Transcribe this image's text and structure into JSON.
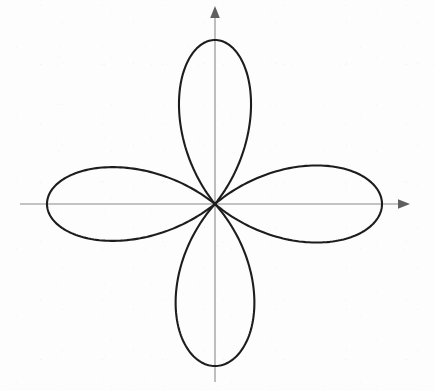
{
  "figure": {
    "name": "four-petaled-rose-curve",
    "background_color": "#fdfdfd",
    "curve_color": "#1d1d1d",
    "axis_color": "#8a8a8a",
    "width": 434,
    "height": 391
  },
  "chart_data": {
    "type": "line",
    "subtype": "polar-rose",
    "title": "",
    "subtitle": "",
    "xlabel": "",
    "ylabel": "",
    "equation": "r = a cos(2θ)",
    "petal_count": 4,
    "petal_amplitude_px": 166,
    "origin_px": {
      "x": 215,
      "y": 204
    },
    "axes": {
      "grid": false,
      "legend": false,
      "x_axis": {
        "from_px": 20,
        "to_px": 410,
        "y_px": 204,
        "arrow": "right"
      },
      "y_axis": {
        "from_px": 6,
        "to_px": 382,
        "x_px": 215,
        "arrow": "up"
      },
      "xlim": [
        -1.17,
        1.17
      ],
      "ylim": [
        -1.19,
        1.19
      ],
      "tick_labels": []
    },
    "petals": [
      {
        "name": "right-petal",
        "theta_center_deg": 0,
        "tip_px": {
          "x": 382,
          "y": 204
        },
        "radius_px": 167,
        "half_width_px": 46
      },
      {
        "name": "top-petal",
        "theta_center_deg": 90,
        "tip_px": {
          "x": 215,
          "y": 40
        },
        "radius_px": 164,
        "half_width_px": 43
      },
      {
        "name": "left-petal",
        "theta_center_deg": 180,
        "tip_px": {
          "x": 47,
          "y": 204
        },
        "radius_px": 168,
        "half_width_px": 44
      },
      {
        "name": "bottom-petal",
        "theta_center_deg": 270,
        "tip_px": {
          "x": 215,
          "y": 366
        },
        "radius_px": 162,
        "half_width_px": 47
      }
    ],
    "series": [
      {
        "name": "r = a cos(2θ)",
        "theta_deg": [
          0,
          10,
          20,
          30,
          40,
          45,
          50,
          60,
          70,
          80,
          90,
          100,
          110,
          120,
          130,
          135,
          140,
          150,
          160,
          170,
          180,
          190,
          200,
          210,
          220,
          225,
          230,
          240,
          250,
          260,
          270,
          280,
          290,
          300,
          310,
          315,
          320,
          330,
          340,
          350,
          360
        ],
        "r": [
          1,
          0.94,
          0.766,
          0.5,
          0.174,
          0,
          -0.174,
          -0.5,
          -0.766,
          -0.94,
          -1,
          -0.94,
          -0.766,
          -0.5,
          -0.174,
          0,
          0.174,
          0.5,
          0.766,
          0.94,
          1,
          0.94,
          0.766,
          0.5,
          0.174,
          0,
          -0.174,
          -0.5,
          -0.766,
          -0.94,
          -1,
          -0.94,
          -0.766,
          -0.5,
          -0.174,
          0,
          0.174,
          0.5,
          0.766,
          0.94,
          1
        ]
      }
    ],
    "annotations": []
  }
}
